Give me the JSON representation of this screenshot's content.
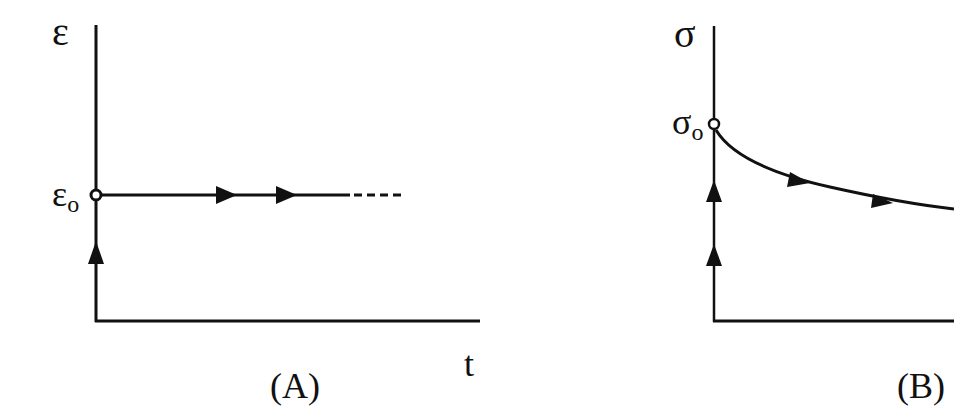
{
  "figure": {
    "background": "#ffffff",
    "stroke_color": "#111111",
    "panels": [
      {
        "id": "A",
        "caption": "(A)",
        "y_axis_label": "ε",
        "x_axis_label": "t",
        "level_label": {
          "symbol": "ε",
          "subscript": "o"
        },
        "description": "Strain jumps to ε0 instantly and stays constant over time (creep test input)",
        "curve": "horizontal line at ε0, solid then dashed continuation",
        "arrows_on_vertical": 1,
        "arrows_on_curve": 2
      },
      {
        "id": "B",
        "caption": "(B)",
        "y_axis_label": "σ",
        "x_axis_label": "",
        "level_label": {
          "symbol": "σ",
          "subscript": "o"
        },
        "description": "Stress jumps to σ0 then decays over time (stress relaxation)",
        "curve": "decaying curve starting at σ0",
        "arrows_on_vertical": 2,
        "arrows_on_curve": 2
      }
    ]
  }
}
